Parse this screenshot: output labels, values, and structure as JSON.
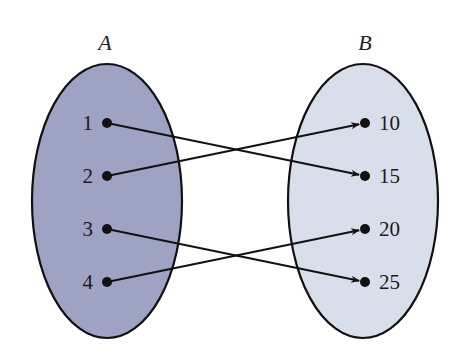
{
  "diagram": {
    "type": "mapping-diagram",
    "sets": [
      {
        "name": "A",
        "fill": "#9ea3c4",
        "ellipse": {
          "cx": 107,
          "cy": 201,
          "rx": 75,
          "ry": 137
        },
        "label_pos": {
          "x": 105,
          "y": 50
        },
        "elements": [
          {
            "label": "1",
            "x": 107,
            "y": 123
          },
          {
            "label": "2",
            "x": 107,
            "y": 176
          },
          {
            "label": "3",
            "x": 107,
            "y": 229
          },
          {
            "label": "4",
            "x": 107,
            "y": 282
          }
        ]
      },
      {
        "name": "B",
        "fill": "#d9dfea",
        "ellipse": {
          "cx": 363,
          "cy": 201,
          "rx": 75,
          "ry": 137
        },
        "label_pos": {
          "x": 365,
          "y": 50
        },
        "elements": [
          {
            "label": "10",
            "x": 365,
            "y": 123
          },
          {
            "label": "15",
            "x": 365,
            "y": 176
          },
          {
            "label": "20",
            "x": 365,
            "y": 229
          },
          {
            "label": "25",
            "x": 365,
            "y": 282
          }
        ]
      }
    ],
    "mappings": [
      {
        "from": "1",
        "to": "15"
      },
      {
        "from": "2",
        "to": "10"
      },
      {
        "from": "3",
        "to": "25"
      },
      {
        "from": "4",
        "to": "20"
      }
    ],
    "stroke_color": "#111111"
  }
}
